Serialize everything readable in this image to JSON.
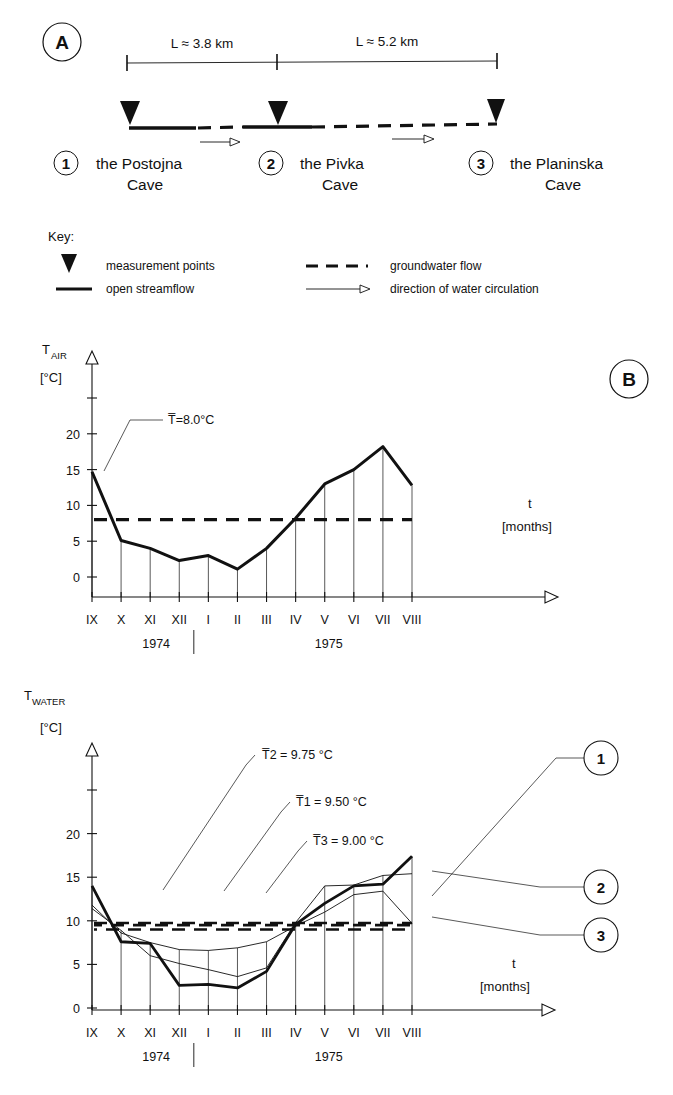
{
  "panels": {
    "a_letter": "A",
    "b_letter": "B"
  },
  "schematic": {
    "distances": [
      {
        "label": "L ≈ 3.8 km"
      },
      {
        "label": "L ≈ 5.2 km"
      }
    ],
    "caves": [
      {
        "num": "1",
        "line1": "the Postojna",
        "line2": "Cave"
      },
      {
        "num": "2",
        "line1": "the Pivka",
        "line2": "Cave"
      },
      {
        "num": "3",
        "line1": "the Planinska",
        "line2": "Cave"
      }
    ]
  },
  "key": {
    "title": "Key:",
    "items": [
      {
        "icon": "triangle-marker-icon",
        "label": "measurement points"
      },
      {
        "icon": "solid-line-icon",
        "label": "open streamflow"
      },
      {
        "icon": "dashed-line-icon",
        "label": "groundwater flow"
      },
      {
        "icon": "arrow-icon",
        "label": "direction of water circulation"
      }
    ]
  },
  "chart_data": [
    {
      "type": "line",
      "id": "air-temperature",
      "title": "",
      "ylabel": "T",
      "ylabel_sub": "AIR",
      "yunit": "[°C]",
      "xlabel": "t",
      "xunit": "[months]",
      "ylim": [
        0,
        25
      ],
      "yticks": [
        0,
        5,
        10,
        15,
        20
      ],
      "ytick_labels": [
        "0",
        "5",
        "10",
        "15",
        "20"
      ],
      "categories": [
        "IX",
        "X",
        "XI",
        "XII",
        "I",
        "II",
        "III",
        "IV",
        "V",
        "VI",
        "VII",
        "VIII"
      ],
      "years": [
        {
          "label": "1974",
          "at": "XI"
        },
        {
          "label": "1975",
          "at": "V"
        }
      ],
      "grid": "vertical-droplines",
      "legend": "none",
      "series": [
        {
          "name": "T air",
          "values": [
            14.7,
            5.1,
            4.0,
            2.3,
            3.0,
            1.1,
            4.0,
            8.2,
            13.0,
            15.0,
            18.2,
            12.8
          ]
        }
      ],
      "reference_lines": [
        {
          "label": "T̅0=8.0°C",
          "text": "T̅=8.0°C",
          "value": 8.0,
          "style": "dashed"
        }
      ]
    },
    {
      "type": "line",
      "id": "water-temperature",
      "title": "",
      "ylabel": "T",
      "ylabel_sub": "WATER",
      "yunit": "[°C]",
      "xlabel": "t",
      "xunit": "[months]",
      "ylim": [
        0,
        25
      ],
      "yticks": [
        0,
        5,
        10,
        15,
        20
      ],
      "ytick_labels": [
        "0",
        "5",
        "10",
        "15",
        "20"
      ],
      "categories": [
        "IX",
        "X",
        "XI",
        "XII",
        "I",
        "II",
        "III",
        "IV",
        "V",
        "VI",
        "VII",
        "VIII"
      ],
      "years": [
        {
          "label": "1974",
          "at": "XI"
        },
        {
          "label": "1975",
          "at": "V"
        }
      ],
      "grid": "vertical-droplines",
      "legend": "right-callouts",
      "series": [
        {
          "name": "1",
          "label": "1",
          "values": [
            14.0,
            7.6,
            7.4,
            2.6,
            2.7,
            2.3,
            4.2,
            9.6,
            12.0,
            14.0,
            14.2,
            17.4
          ]
        },
        {
          "name": "2",
          "label": "2",
          "values": [
            11.4,
            8.9,
            6.0,
            5.1,
            4.4,
            3.6,
            4.6,
            9.8,
            14.0,
            14.1,
            15.2,
            15.4
          ]
        },
        {
          "name": "3",
          "label": "3",
          "values": [
            11.8,
            8.6,
            7.5,
            6.7,
            6.6,
            6.9,
            7.6,
            9.4,
            11.0,
            13.0,
            13.4,
            9.7
          ]
        }
      ],
      "reference_lines": [
        {
          "label": "T2",
          "text": "T̅2 = 9.75 °C",
          "value": 9.75,
          "style": "dashed"
        },
        {
          "label": "T1",
          "text": "T̅1 = 9.50 °C",
          "value": 9.5,
          "style": "dashed"
        },
        {
          "label": "T3",
          "text": "T̅3 = 9.00 °C",
          "value": 9.0,
          "style": "dashed"
        }
      ]
    }
  ],
  "colors": {
    "ink": "#111111",
    "paper": "#ffffff"
  }
}
